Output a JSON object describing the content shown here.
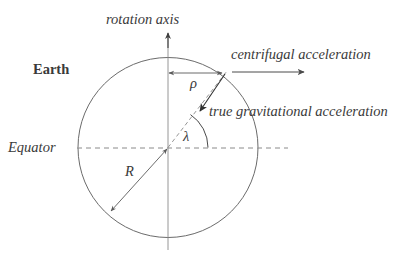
{
  "figure": {
    "type": "diagram",
    "background_color": "#ffffff",
    "stroke_color": "#555555",
    "text_color": "#3a3a3a"
  },
  "labels": {
    "rotation_axis": "rotation axis",
    "centrifugal": "centrifugal acceleration",
    "true_gravitational": "true gravitational acceleration",
    "earth": "Earth",
    "equator": "Equator",
    "rho": "ρ",
    "lambda": "λ",
    "radius": "R"
  },
  "geometry": {
    "circle": {
      "cx": 168,
      "cy": 147.5,
      "r": 90
    },
    "rotation_axis_line": {
      "x": 168,
      "y_top": 32,
      "y_bottom": 250
    },
    "equator_line": {
      "y": 148,
      "x_start": 77,
      "x_end": 288
    },
    "rho_arrow": {
      "y": 73,
      "x_start": 168,
      "x_end": 223,
      "double_headed": true
    },
    "centrifugal_arrow": {
      "y": 72,
      "x_start": 232,
      "x_end": 305
    },
    "gravitational_arrow": {
      "x_start": 224,
      "y_start": 75,
      "x_end": 199,
      "y_end": 112
    },
    "radius_arrow": {
      "x_start": 168,
      "y_start": 148,
      "x_end": 110,
      "y_end": 212,
      "double_headed": true
    },
    "latitude_arc": {
      "cx": 168,
      "cy": 147.5,
      "radius": 40,
      "start_deg": 0,
      "end_deg": 56
    },
    "latitude_dashed_radius": {
      "x_start": 168,
      "y_start": 147.5,
      "x_end": 226,
      "y_end": 72
    }
  }
}
